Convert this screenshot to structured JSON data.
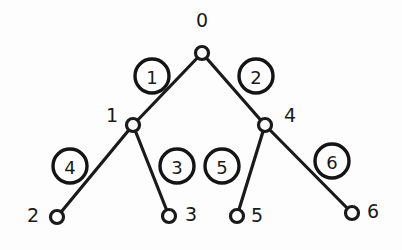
{
  "diagram": {
    "type": "binary-tree",
    "background_color": "#fdfdfd",
    "stroke_color": "#1a1a1a",
    "nodes": [
      {
        "id": "node-0",
        "label": "0",
        "x": 202,
        "y": 53,
        "label_x": 202,
        "label_y": 27,
        "label_anchor": "middle"
      },
      {
        "id": "node-1",
        "label": "1",
        "x": 133,
        "y": 125,
        "label_x": 112,
        "label_y": 122,
        "label_anchor": "middle"
      },
      {
        "id": "node-4",
        "label": "4",
        "x": 265,
        "y": 125,
        "label_x": 290,
        "label_y": 122,
        "label_anchor": "middle"
      },
      {
        "id": "node-2",
        "label": "2",
        "x": 57,
        "y": 217,
        "label_x": 33,
        "label_y": 222,
        "label_anchor": "middle"
      },
      {
        "id": "node-3",
        "label": "3",
        "x": 169,
        "y": 216,
        "label_x": 191,
        "label_y": 221,
        "label_anchor": "middle"
      },
      {
        "id": "node-5",
        "label": "5",
        "x": 237,
        "y": 216,
        "label_x": 257,
        "label_y": 222,
        "label_anchor": "middle"
      },
      {
        "id": "node-6",
        "label": "6",
        "x": 352,
        "y": 213,
        "label_x": 373,
        "label_y": 218,
        "label_anchor": "middle"
      }
    ],
    "node_radius": 6.5,
    "edges": [
      {
        "id": "edge-1",
        "label": "1",
        "from": "node-0",
        "to": "node-1",
        "x1": 202,
        "y1": 53,
        "x2": 133,
        "y2": 125,
        "badge_x": 152,
        "badge_y": 76
      },
      {
        "id": "edge-2",
        "label": "2",
        "from": "node-0",
        "to": "node-4",
        "x1": 202,
        "y1": 53,
        "x2": 265,
        "y2": 125,
        "badge_x": 256,
        "badge_y": 76
      },
      {
        "id": "edge-4",
        "label": "4",
        "from": "node-1",
        "to": "node-2",
        "x1": 133,
        "y1": 125,
        "x2": 57,
        "y2": 217,
        "badge_x": 70,
        "badge_y": 166
      },
      {
        "id": "edge-3",
        "label": "3",
        "from": "node-1",
        "to": "node-3",
        "x1": 133,
        "y1": 125,
        "x2": 169,
        "y2": 216,
        "badge_x": 177,
        "badge_y": 166
      },
      {
        "id": "edge-5",
        "label": "5",
        "from": "node-4",
        "to": "node-5",
        "x1": 265,
        "y1": 125,
        "x2": 237,
        "y2": 216,
        "badge_x": 222,
        "badge_y": 166
      },
      {
        "id": "edge-6",
        "label": "6",
        "from": "node-4",
        "to": "node-6",
        "x1": 265,
        "y1": 125,
        "x2": 352,
        "y2": 213,
        "badge_x": 332,
        "badge_y": 161
      }
    ],
    "edge_badge_radius": 17
  }
}
